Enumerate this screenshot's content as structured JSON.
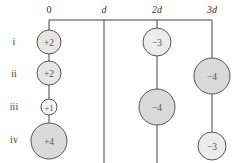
{
  "axis": {
    "ticks": [
      {
        "label": "0",
        "x": 49
      },
      {
        "label": "d",
        "x": 104
      },
      {
        "label": "2d",
        "x": 157
      },
      {
        "label": "3d",
        "x": 212
      }
    ]
  },
  "rows": [
    {
      "label": "i",
      "y": 42
    },
    {
      "label": "ii",
      "y": 74
    },
    {
      "label": "iii",
      "y": 107
    },
    {
      "label": "iv",
      "y": 140
    }
  ],
  "charges": [
    {
      "id": "i-0",
      "value": "+2",
      "x": 49,
      "y": 42,
      "r": 12,
      "fill": "#e6e6e6"
    },
    {
      "id": "ii-0",
      "value": "+2",
      "x": 49,
      "y": 73,
      "r": 12,
      "fill": "#e6e6e6"
    },
    {
      "id": "iii-0",
      "value": "+1",
      "x": 49,
      "y": 107,
      "r": 8,
      "fill": "#f7f7f7"
    },
    {
      "id": "iv-0",
      "value": "+4",
      "x": 49,
      "y": 141,
      "r": 18,
      "fill": "#dadada"
    },
    {
      "id": "i-2d",
      "value": "−3",
      "x": 157,
      "y": 42,
      "r": 14,
      "fill": "#ececec"
    },
    {
      "id": "ii-3d",
      "value": "−4",
      "x": 212,
      "y": 76,
      "r": 18,
      "fill": "#dadada"
    },
    {
      "id": "iii-2d",
      "value": "−4",
      "x": 157,
      "y": 107,
      "r": 18,
      "fill": "#dadada"
    },
    {
      "id": "iv-3d",
      "value": "−3",
      "x": 212,
      "y": 146,
      "r": 14,
      "fill": "#ececec"
    }
  ]
}
